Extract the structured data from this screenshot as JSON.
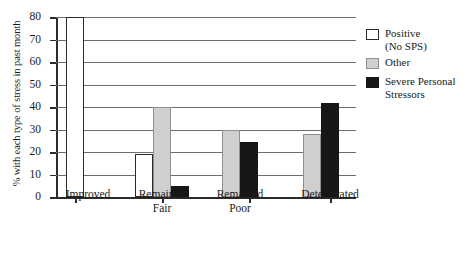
{
  "chart_data": {
    "type": "bar",
    "title": "",
    "subtitle": "",
    "xlabel": "",
    "ylabel": "% with each type of stress in past month",
    "ylim": [
      0,
      80
    ],
    "ytick_values": [
      0,
      10,
      20,
      30,
      40,
      50,
      60,
      70,
      80
    ],
    "ytick_labels": [
      "0",
      "10",
      "20",
      "30",
      "40",
      "50",
      "60",
      "70",
      "80"
    ],
    "grid": true,
    "grid_axis": "y",
    "legend_position": "right",
    "categories": [
      "Improved",
      "Remained\nFair",
      "Remained\nPoor",
      "Deteriorated"
    ],
    "series": [
      {
        "name": "Positive\n(No SPS)",
        "key": "positive",
        "color": "#ffffff",
        "edge_color": "#2b2b2b",
        "values": [
          80,
          19,
          null,
          null
        ]
      },
      {
        "name": "Other",
        "key": "other",
        "color": "#cfcfcf",
        "edge_color": "#8f8f8f",
        "values": [
          null,
          40,
          30,
          28
        ]
      },
      {
        "name": "Severe Personal\nStressors",
        "key": "sps",
        "color": "#161616",
        "edge_color": "#161616",
        "values": [
          null,
          5,
          24.5,
          42
        ]
      }
    ],
    "bars": [
      {
        "category": "Improved",
        "series": "Positive (No SPS)",
        "value": 80,
        "x": 10,
        "width": 18,
        "style": "white"
      },
      {
        "category": "Remained Fair",
        "series": "Positive (No SPS)",
        "value": 19,
        "x": 79,
        "width": 18,
        "style": "white"
      },
      {
        "category": "Remained Fair",
        "series": "Other",
        "value": 40,
        "x": 97,
        "width": 18,
        "style": "gray"
      },
      {
        "category": "Remained Fair",
        "series": "Severe Personal Stressors",
        "value": 5,
        "x": 115,
        "width": 18,
        "style": "black"
      },
      {
        "category": "Remained Poor",
        "series": "Other",
        "value": 30,
        "x": 166,
        "width": 18,
        "style": "gray"
      },
      {
        "category": "Remained Poor",
        "series": "Severe Personal Stressors",
        "value": 24.5,
        "x": 184,
        "width": 18,
        "style": "black"
      },
      {
        "category": "Deteriorated",
        "series": "Other",
        "value": 28,
        "x": 247,
        "width": 18,
        "style": "gray"
      },
      {
        "category": "Deteriorated",
        "series": "Severe Personal Stressors",
        "value": 42,
        "x": 265,
        "width": 18,
        "style": "black"
      }
    ],
    "category_tick_positions": [
      19,
      106,
      193,
      274
    ],
    "category_label_centers": [
      32,
      106,
      184,
      274
    ]
  },
  "legend": {
    "items": [
      {
        "label": "Positive\n(No SPS)",
        "style": "white"
      },
      {
        "label": "Other",
        "style": "gray"
      },
      {
        "label": "Severe Personal\nStressors",
        "style": "black"
      }
    ]
  }
}
